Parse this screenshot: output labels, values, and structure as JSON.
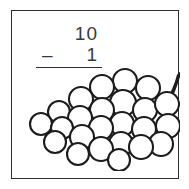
{
  "card": {
    "background_color": "#ffffff",
    "border_color": "#2e2e2e"
  },
  "problem": {
    "minuend": "10",
    "operator": "–",
    "subtrahend": "1",
    "answer": "",
    "text_color": "#3a3a3a",
    "rule_color": "#2f2f2f"
  },
  "illustration": {
    "name": "grape-cluster",
    "berry_count": 24,
    "stroke_color": "#1c1c1c",
    "fill_color": "#ffffff",
    "berries": [
      {
        "cx": 103,
        "cy": 15,
        "r": 12
      },
      {
        "cx": 80,
        "cy": 21,
        "r": 12
      },
      {
        "cx": 126,
        "cy": 22,
        "r": 12
      },
      {
        "cx": 59,
        "cy": 33,
        "r": 12
      },
      {
        "cx": 101,
        "cy": 37,
        "r": 13
      },
      {
        "cx": 123,
        "cy": 44,
        "r": 12
      },
      {
        "cx": 145,
        "cy": 38,
        "r": 12
      },
      {
        "cx": 80,
        "cy": 44,
        "r": 12
      },
      {
        "cx": 37,
        "cy": 46,
        "r": 11
      },
      {
        "cx": 58,
        "cy": 52,
        "r": 12
      },
      {
        "cx": 146,
        "cy": 60,
        "r": 12
      },
      {
        "cx": 19,
        "cy": 58,
        "r": 11
      },
      {
        "cx": 40,
        "cy": 62,
        "r": 11
      },
      {
        "cx": 100,
        "cy": 58,
        "r": 12
      },
      {
        "cx": 122,
        "cy": 63,
        "r": 12
      },
      {
        "cx": 79,
        "cy": 62,
        "r": 12
      },
      {
        "cx": 60,
        "cy": 71,
        "r": 12
      },
      {
        "cx": 33,
        "cy": 76,
        "r": 11
      },
      {
        "cx": 139,
        "cy": 78,
        "r": 12
      },
      {
        "cx": 99,
        "cy": 78,
        "r": 12
      },
      {
        "cx": 119,
        "cy": 81,
        "r": 12
      },
      {
        "cx": 79,
        "cy": 83,
        "r": 12
      },
      {
        "cx": 56,
        "cy": 88,
        "r": 11
      },
      {
        "cx": 97,
        "cy": 94,
        "r": 11
      }
    ],
    "stem_path": "M 148 34 C 153 24, 156 14, 158 7"
  }
}
